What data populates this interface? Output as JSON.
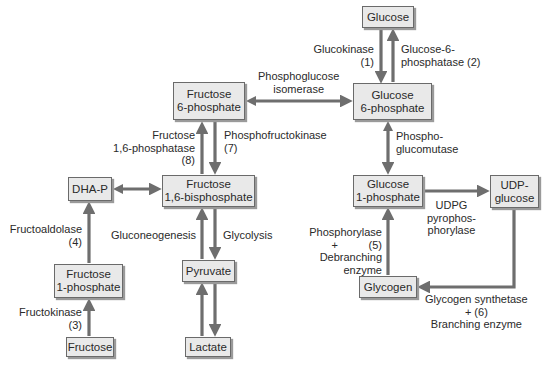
{
  "diagram": {
    "type": "metabolic-pathway",
    "nodes": {
      "glucose": {
        "line1": "Glucose",
        "line2": ""
      },
      "glucose_6p": {
        "line1": "Glucose",
        "line2": "6-phosphate"
      },
      "fructose_6p": {
        "line1": "Fructose",
        "line2": "6-phosphate"
      },
      "fructose_16bp": {
        "line1": "Fructose",
        "line2": "1,6-bisphosphate"
      },
      "dhap": {
        "line1": "DHA-P",
        "line2": ""
      },
      "fructose_1p": {
        "line1": "Fructose",
        "line2": "1-phosphate"
      },
      "fructose": {
        "line1": "Fructose",
        "line2": ""
      },
      "pyruvate": {
        "line1": "Pyruvate",
        "line2": ""
      },
      "lactate": {
        "line1": "Lactate",
        "line2": ""
      },
      "glucose_1p": {
        "line1": "Glucose",
        "line2": "1-phosphate"
      },
      "udp_glucose": {
        "line1": "UDP-",
        "line2": "glucose"
      },
      "glycogen": {
        "line1": "Glycogen",
        "line2": ""
      }
    },
    "labels": {
      "glucokinase": "Glucokinase\n(1)",
      "glucose_6_phosphatase": "Glucose-6-\nphosphatase (2)",
      "phosphoglucose_isomerase": "Phosphoglucose\nisomerase",
      "fructose_16_phosphatase": "Fructose\n1,6-phosphatase\n(8)",
      "phosphofructokinase": "Phosphofructokinase\n(7)",
      "phosphoglucomutase": "Phospho-\nglucomutase",
      "fructoaldolase": "Fructoaldolase\n(4)",
      "gluconeogenesis": "Gluconeogenesis",
      "glycolysis": "Glycolysis",
      "fructokinase": "Fructokinase\n(3)",
      "udpg_pyrophosphorylase": "UDPG\npyrophos-\nphorylase",
      "phosphorylase": "Phosphorylase\n+          (5)\nDebranching\nenzyme",
      "glycogen_synthetase": "Glycogen synthetase\n+ (6)\nBranching enzyme"
    },
    "colors": {
      "arrow": "#6e6e6e",
      "node_fill": "#e9e9e9",
      "node_border": "#6a6a6a",
      "text": "#2a2a2a"
    }
  }
}
